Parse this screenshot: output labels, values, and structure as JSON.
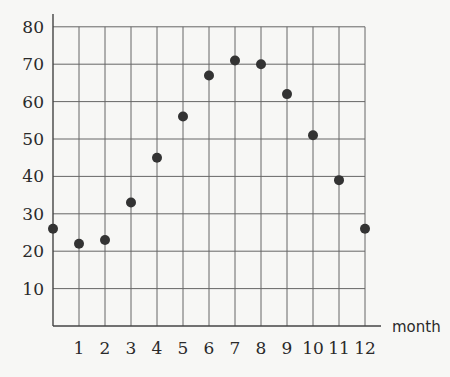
{
  "chart_data": {
    "type": "scatter",
    "title": "",
    "xlabel": "month",
    "ylabel": "",
    "x": [
      0,
      1,
      2,
      3,
      4,
      5,
      6,
      7,
      8,
      9,
      10,
      11,
      12
    ],
    "values": [
      26,
      22,
      23,
      33,
      45,
      56,
      67,
      71,
      70,
      62,
      51,
      39,
      26
    ],
    "xticks": [
      "1",
      "2",
      "3",
      "4",
      "5",
      "6",
      "7",
      "8",
      "9",
      "10",
      "11",
      "12"
    ],
    "yticks": [
      "10",
      "20",
      "30",
      "40",
      "50",
      "60",
      "70",
      "80"
    ],
    "xlim": [
      0,
      12
    ],
    "ylim": [
      0,
      80
    ],
    "grid": true,
    "legend": null,
    "colors": {
      "grid": "#666666",
      "point": "#333333",
      "background": "#f7f7f5"
    }
  }
}
